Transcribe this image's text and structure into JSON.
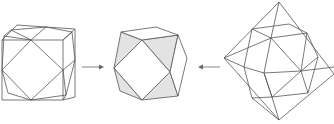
{
  "figure": {
    "panels": [
      {
        "name": "cube-with-cuboctahedron",
        "label": ""
      },
      {
        "name": "cuboctahedron",
        "label": ""
      },
      {
        "name": "octahedron-with-cuboctahedron",
        "label": ""
      }
    ],
    "arrows": [
      {
        "name": "arrow-right",
        "direction": "right"
      },
      {
        "name": "arrow-left",
        "direction": "left"
      }
    ],
    "colors": {
      "edge": "#555555",
      "shaded_face": "#e3e3e3",
      "arrow": "#777777",
      "background": "#ffffff"
    }
  }
}
